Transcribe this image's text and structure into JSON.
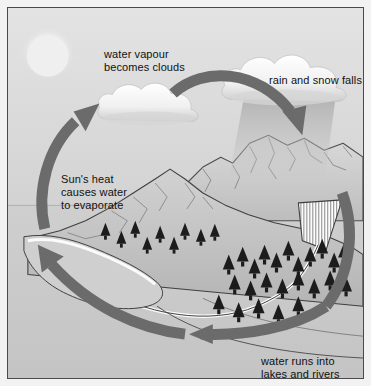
{
  "diagram": {
    "labels": [
      {
        "id": "water-vapour",
        "text": "water vapour\nbecomes clouds"
      },
      {
        "id": "rain-snow",
        "text": "rain and snow falls"
      },
      {
        "id": "suns-heat",
        "text": "Sun's heat\ncauses water\nto evaporate"
      },
      {
        "id": "water-runs",
        "text": "water runs into\nlakes and rivers"
      }
    ],
    "elements": [
      {
        "name": "sun",
        "description": "pale sun disc in upper-left sky"
      },
      {
        "name": "cloud-left",
        "description": "white cumulus cloud left of centre"
      },
      {
        "name": "cloud-rain",
        "description": "white cumulus cloud upper right with precipitation shaft"
      },
      {
        "name": "rain-shaft",
        "description": "grey falling rain and snow band below right cloud"
      },
      {
        "name": "mountains",
        "description": "grey mountain range with ridge lines"
      },
      {
        "name": "glacier",
        "description": "white hatched triangular snowfield on mountain"
      },
      {
        "name": "forest",
        "description": "dark conifer trees on lower slopes"
      },
      {
        "name": "river",
        "description": "winding river running to the lake"
      },
      {
        "name": "lake",
        "description": "flat water body in foreground left"
      },
      {
        "name": "arrow-evaporation",
        "direction": "up",
        "description": "arrow rising from lake to cloud"
      },
      {
        "name": "arrow-condensation",
        "direction": "right-down",
        "description": "arrow from cloud across to rain cloud"
      },
      {
        "name": "arrow-precipitation",
        "direction": "down",
        "description": "arrow descending along right side"
      },
      {
        "name": "arrow-runoff",
        "direction": "left-up",
        "description": "arrow sweeping left along foreground"
      }
    ],
    "colors": {
      "sky": "#dcdcdc",
      "ground": "#c9c9c9",
      "arrow": "#6b6b6b",
      "cloud": "#fbfbfb",
      "tree": "#1c1c1c",
      "frame": "#4a4a4a",
      "text": "#111111"
    }
  }
}
